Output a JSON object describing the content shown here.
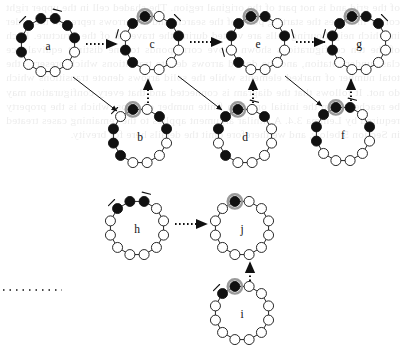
{
  "figure": {
    "kind": "state-transition-diagram",
    "ring_node_count": 12,
    "colors": {
      "filled_node": "#111111",
      "open_node": "#ffffff",
      "node_stroke": "#111111",
      "highlight_halo": "#9a9a9a",
      "ring_edge": "#111111",
      "arrow": "#111111",
      "background": "#ffffff"
    },
    "node_radius": 5.0,
    "highlight_halo_radius": 7.2,
    "ring_radius": 27.5
  },
  "diagrams": [
    {
      "id": "a",
      "label": "a",
      "cx": 48,
      "cy": 45,
      "rotation": -15,
      "states": [
        "filled",
        "filled",
        "filled",
        "filled",
        "open",
        "open",
        "open",
        "open",
        "open",
        "filled",
        "filled",
        "filled"
      ],
      "highlight_index": null,
      "ticks": [
        11,
        1
      ]
    },
    {
      "id": "c",
      "label": "c",
      "cx": 152,
      "cy": 43,
      "rotation": -15,
      "states": [
        "filled",
        "open",
        "filled",
        "filled",
        "open",
        "open",
        "open",
        "open",
        "filled",
        "filled",
        "open",
        "filled"
      ],
      "highlight_index": 0,
      "ticks": [
        10,
        2
      ]
    },
    {
      "id": "e",
      "label": "e",
      "cx": 258,
      "cy": 43,
      "rotation": -15,
      "states": [
        "filled",
        "filled",
        "open",
        "filled",
        "open",
        "open",
        "open",
        "open",
        "filled",
        "open",
        "filled",
        "filled"
      ],
      "highlight_index": 0,
      "ticks": [
        9,
        3
      ]
    },
    {
      "id": "g",
      "label": "g",
      "cx": 359,
      "cy": 43,
      "rotation": -15,
      "states": [
        "filled",
        "filled",
        "filled",
        "open",
        "open",
        "open",
        "open",
        "open",
        "open",
        "filled",
        "filled",
        "filled"
      ],
      "highlight_index": 0,
      "ticks": [
        10,
        2
      ]
    },
    {
      "id": "b",
      "label": "b",
      "cx": 140,
      "cy": 136,
      "rotation": -15,
      "states": [
        "filled",
        "open",
        "filled",
        "filled",
        "open",
        "open",
        "open",
        "open",
        "filled",
        "filled",
        "filled",
        "open"
      ],
      "highlight_index": 0,
      "ticks": [
        11
      ]
    },
    {
      "id": "d",
      "label": "d",
      "cx": 245,
      "cy": 136,
      "rotation": -15,
      "states": [
        "filled",
        "open",
        "filled",
        "open",
        "open",
        "open",
        "open",
        "open",
        "filled",
        "open",
        "filled",
        "filled"
      ],
      "highlight_index": 0,
      "ticks": [
        1
      ]
    },
    {
      "id": "f",
      "label": "f",
      "cx": 343,
      "cy": 134,
      "rotation": -15,
      "states": [
        "filled",
        "filled",
        "open",
        "filled",
        "open",
        "open",
        "open",
        "open",
        "open",
        "filled",
        "filled",
        "filled"
      ],
      "highlight_index": 0,
      "ticks": [
        1
      ]
    },
    {
      "id": "h",
      "label": "h",
      "cx": 137,
      "cy": 228,
      "rotation": -15,
      "states": [
        "filled",
        "filled",
        "open",
        "open",
        "open",
        "open",
        "open",
        "open",
        "open",
        "open",
        "open",
        "filled"
      ],
      "highlight_index": null,
      "ticks": [
        11,
        1
      ]
    },
    {
      "id": "j",
      "label": "j",
      "cx": 242,
      "cy": 228,
      "rotation": -15,
      "states": [
        "filled",
        "open",
        "open",
        "open",
        "open",
        "open",
        "open",
        "open",
        "open",
        "open",
        "open",
        "open"
      ],
      "highlight_index": 0,
      "ticks": []
    },
    {
      "id": "i",
      "label": "i",
      "cx": 242,
      "cy": 313,
      "rotation": -15,
      "states": [
        "filled",
        "open",
        "open",
        "open",
        "open",
        "open",
        "open",
        "open",
        "open",
        "open",
        "open",
        "filled"
      ],
      "highlight_index": 0,
      "ticks": [
        11
      ]
    }
  ],
  "arrows": [
    {
      "from": "a",
      "to": "c",
      "style": "dotted",
      "x1": 86,
      "y1": 44,
      "x2": 117,
      "y2": 44
    },
    {
      "from": "c",
      "to": "e",
      "style": "dotted",
      "x1": 190,
      "y1": 42,
      "x2": 222,
      "y2": 42
    },
    {
      "from": "e",
      "to": "g",
      "style": "dotted",
      "x1": 296,
      "y1": 42,
      "x2": 325,
      "y2": 42
    },
    {
      "from": "a",
      "to": "b",
      "style": "solid",
      "x1": 73,
      "y1": 77,
      "x2": 117,
      "y2": 111
    },
    {
      "from": "c",
      "to": "d",
      "style": "solid",
      "x1": 178,
      "y1": 76,
      "x2": 222,
      "y2": 110
    },
    {
      "from": "e",
      "to": "f",
      "style": "solid",
      "x1": 285,
      "y1": 76,
      "x2": 322,
      "y2": 106
    },
    {
      "from": "b",
      "to": "c",
      "style": "dotted",
      "x1": 148,
      "y1": 103,
      "x2": 148,
      "y2": 79
    },
    {
      "from": "d",
      "to": "e",
      "style": "dotted",
      "x1": 253,
      "y1": 103,
      "x2": 253,
      "y2": 79
    },
    {
      "from": "f",
      "to": "g",
      "style": "dotted",
      "x1": 351,
      "y1": 101,
      "x2": 351,
      "y2": 79
    },
    {
      "from": "h",
      "to": "j",
      "style": "dotted",
      "x1": 175,
      "y1": 224,
      "x2": 207,
      "y2": 224
    },
    {
      "from": "i",
      "to": "j",
      "style": "dotted",
      "x1": 250,
      "y1": 281,
      "x2": 250,
      "y2": 262
    }
  ],
  "dotted_rule": {
    "x1": 3,
    "y1": 290,
    "x2": 62,
    "y2": 290
  },
  "bleed_text": "of the grid and is not part of the original region. The shaded cell in the upper right corner indicates the starting point of the search, and the arrows represent the order in which neighbouring cells are visited during the traversal of the structure. Each of the ten configurations shown above corresponds to one distinct equivalence class under rotation, and the dotted arrows denote transitions which preserve the total number of marked elements while the solid arrows denote transitions which do not. It follows that the diagram is connected and that every configuration may be reached from the initial one in a finite number of steps, which is the property required by Lemma 3.4. A similar argument applies to the remaining cases treated in Section 5 below, and we therefore omit the details here for brevity."
}
